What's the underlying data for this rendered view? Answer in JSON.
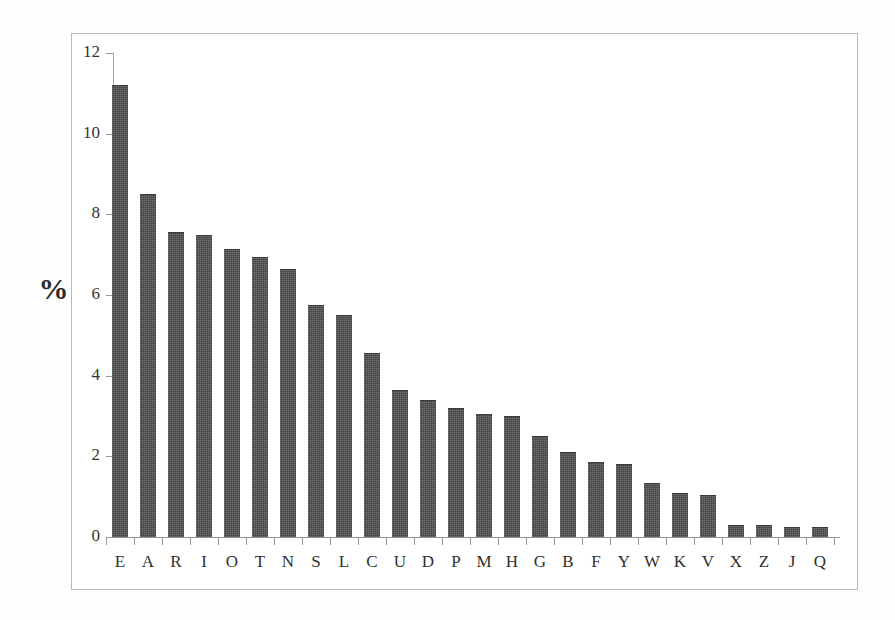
{
  "chart_data": {
    "type": "bar",
    "title": "",
    "subtitle": "",
    "xlabel": "",
    "ylabel": "%",
    "ylim": [
      0,
      12
    ],
    "y_ticks": [
      0,
      2,
      4,
      6,
      8,
      10,
      12
    ],
    "grid": false,
    "legend": null,
    "bar_color": "#4c4c4c",
    "axis_color": "#9a9a9a",
    "frame_color": "#b9b9b9",
    "categories": [
      "E",
      "A",
      "R",
      "I",
      "O",
      "T",
      "N",
      "S",
      "L",
      "C",
      "U",
      "D",
      "P",
      "M",
      "H",
      "G",
      "B",
      "F",
      "Y",
      "W",
      "K",
      "V",
      "X",
      "Z",
      "J",
      "Q"
    ],
    "values": [
      11.2,
      8.5,
      7.55,
      7.5,
      7.15,
      6.95,
      6.65,
      5.75,
      5.5,
      4.55,
      3.65,
      3.4,
      3.2,
      3.05,
      3.0,
      2.5,
      2.1,
      1.85,
      1.8,
      1.35,
      1.1,
      1.05,
      0.3,
      0.3,
      0.25,
      0.25
    ],
    "series": [
      {
        "name": "Letter frequency",
        "values": [
          11.2,
          8.5,
          7.55,
          7.5,
          7.15,
          6.95,
          6.65,
          5.75,
          5.5,
          4.55,
          3.65,
          3.4,
          3.2,
          3.05,
          3.0,
          2.5,
          2.1,
          1.85,
          1.8,
          1.35,
          1.1,
          1.05,
          0.3,
          0.3,
          0.25,
          0.25
        ]
      }
    ],
    "annotations": []
  },
  "axis": {
    "y_title": "%",
    "tick_labels": [
      "0",
      "2",
      "4",
      "6",
      "8",
      "10",
      "12"
    ]
  }
}
